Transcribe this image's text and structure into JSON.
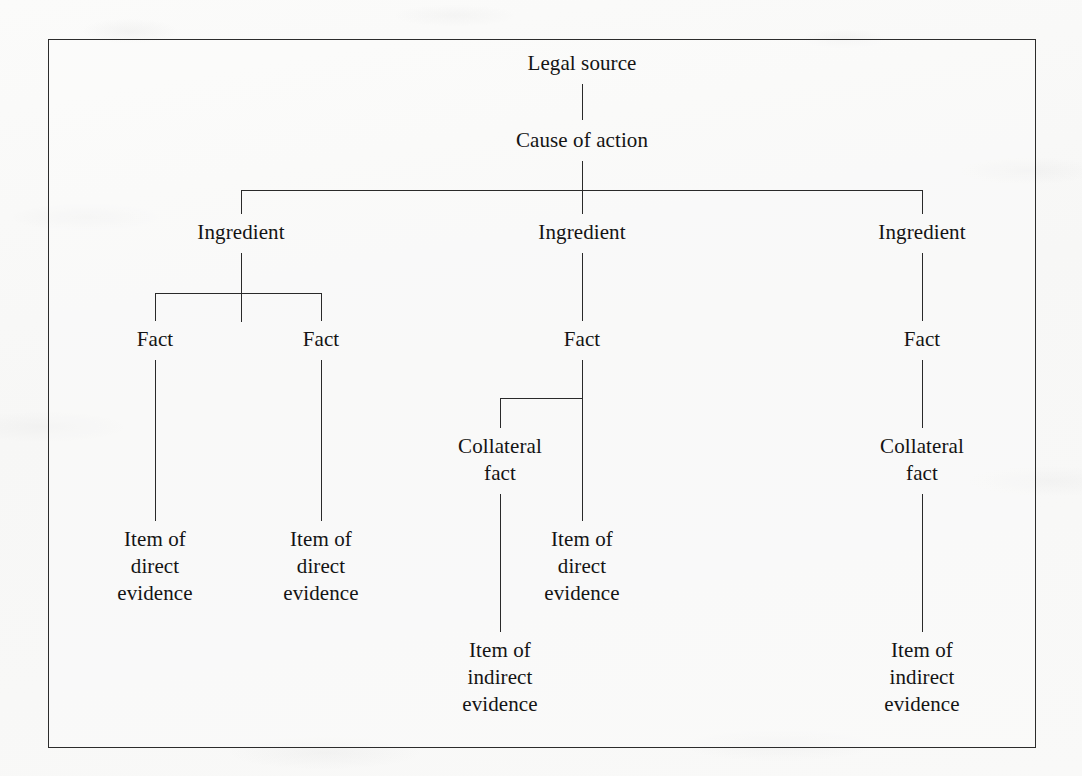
{
  "figure": {
    "type": "tree-diagram",
    "title": "",
    "frame": {
      "border_color": "#2c2c2c",
      "background": "#fcfcfb"
    },
    "line_color": "#2a2a2a",
    "text_color": "#141414"
  },
  "nodes": {
    "legal_source": "Legal source",
    "cause_of_action": "Cause of action",
    "ingredient_1": "Ingredient",
    "ingredient_2": "Ingredient",
    "ingredient_3": "Ingredient",
    "fact_1": "Fact",
    "fact_2": "Fact",
    "fact_3": "Fact",
    "fact_4": "Fact",
    "collateral_fact_1": "Collateral\nfact",
    "collateral_fact_2": "Collateral\nfact",
    "direct_evidence_1": "Item of\ndirect\nevidence",
    "direct_evidence_2": "Item of\ndirect\nevidence",
    "direct_evidence_3": "Item of\ndirect\nevidence",
    "indirect_evidence_1": "Item of\nindirect\nevidence",
    "indirect_evidence_2": "Item of\nindirect\nevidence"
  },
  "tree": {
    "root": "Legal source",
    "levels": [
      "Legal source",
      "Cause of action",
      "Ingredient",
      "Fact",
      "Collateral fact",
      "Item of direct evidence / Item of indirect evidence"
    ],
    "edges": [
      [
        "Legal source",
        "Cause of action"
      ],
      [
        "Cause of action",
        "Ingredient 1"
      ],
      [
        "Cause of action",
        "Ingredient 2"
      ],
      [
        "Cause of action",
        "Ingredient 3"
      ],
      [
        "Ingredient 1",
        "Fact 1"
      ],
      [
        "Ingredient 1",
        "Fact 2"
      ],
      [
        "Ingredient 2",
        "Fact 3"
      ],
      [
        "Ingredient 3",
        "Fact 4"
      ],
      [
        "Fact 1",
        "Item of direct evidence 1"
      ],
      [
        "Fact 2",
        "Item of direct evidence 2"
      ],
      [
        "Fact 3",
        "Item of direct evidence 3"
      ],
      [
        "Fact 3",
        "Collateral fact 1"
      ],
      [
        "Fact 4",
        "Collateral fact 2"
      ],
      [
        "Collateral fact 1",
        "Item of indirect evidence 1"
      ],
      [
        "Collateral fact 2",
        "Item of indirect evidence 2"
      ]
    ]
  }
}
